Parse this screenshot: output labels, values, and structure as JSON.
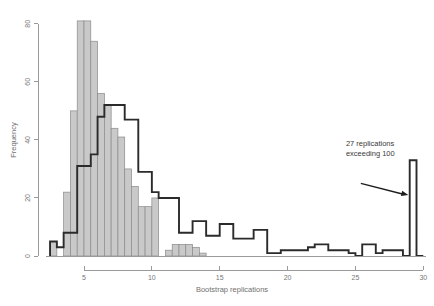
{
  "chart_data": {
    "type": "bar",
    "title": "",
    "xlabel": "Bootstrap replications",
    "ylabel": "Frequency",
    "xlim": [
      2.2,
      30.2
    ],
    "ylim": [
      0,
      82
    ],
    "grid": false,
    "legend_position": "none",
    "bin_width": 0.5,
    "xticks": [
      5,
      10,
      15,
      20,
      25,
      30
    ],
    "yticks": [
      0,
      20,
      40,
      60,
      80
    ],
    "series": [
      {
        "name": "observed-histogram",
        "style": "filled-gray-bars",
        "fill_color": "#c9c9c9",
        "edge_color": "#8b8b8b",
        "bin_starts": [
          2.5,
          3.0,
          3.5,
          4.0,
          4.5,
          5.0,
          5.5,
          6.0,
          6.5,
          7.0,
          7.5,
          8.0,
          8.5,
          9.0,
          9.5,
          10.0,
          10.5,
          11.0,
          11.5,
          12.0,
          12.5,
          13.0,
          13.5,
          14.0
        ],
        "values": [
          5,
          0,
          22,
          50,
          81,
          81,
          74,
          56,
          52,
          44,
          41,
          30,
          24,
          17,
          17,
          20,
          0,
          2,
          4,
          4,
          4,
          3,
          1,
          0
        ]
      },
      {
        "name": "bootstrap-histogram",
        "style": "dark-step-outline",
        "edge_color": "#2b2b2b",
        "bin_starts": [
          2.5,
          3.0,
          3.5,
          4.0,
          4.5,
          5.0,
          5.5,
          6.0,
          6.5,
          7.0,
          7.5,
          8.0,
          8.5,
          9.0,
          9.5,
          10.0,
          10.5,
          11.0,
          11.5,
          12.0,
          12.5,
          13.0,
          13.5,
          14.0,
          14.5,
          15.0,
          15.5,
          16.0,
          16.5,
          17.0,
          17.5,
          18.0,
          18.5,
          19.0,
          19.5,
          20.0,
          20.5,
          21.0,
          21.5,
          22.0,
          22.5,
          23.0,
          23.5,
          24.0,
          24.5,
          25.0,
          25.5,
          26.0,
          26.5,
          27.0,
          27.5,
          28.0,
          28.5,
          29.0,
          29.5
        ],
        "values": [
          5,
          3,
          8,
          8,
          31,
          31,
          35,
          48,
          52,
          52,
          52,
          47,
          47,
          29,
          29,
          22,
          20,
          20,
          20,
          8,
          8,
          12,
          12,
          7,
          7,
          11,
          11,
          6,
          6,
          6,
          9,
          9,
          1,
          1,
          2,
          2,
          2,
          2,
          3,
          4,
          4,
          2,
          2,
          2,
          1,
          0,
          4,
          4,
          1,
          2,
          2,
          2,
          0,
          33,
          0
        ]
      }
    ],
    "annotations": [
      {
        "name": "exceeding-note",
        "line1": "27 replications",
        "line2": "exceeding 100",
        "x": 24.3,
        "y": 38,
        "arrow_from": [
          25.4,
          25
        ],
        "arrow_to": [
          28.9,
          21
        ]
      }
    ]
  }
}
